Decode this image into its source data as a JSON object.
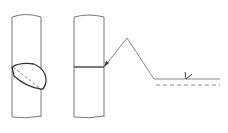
{
  "diagram": {
    "type": "weld-symbol-illustration",
    "background": "#ffffff",
    "stroke_dark": "#444444",
    "stroke_light": "#888888",
    "elements": [
      {
        "name": "tube-with-weld-view",
        "description": "Pipe with elliptical weld section"
      },
      {
        "name": "tube-with-joint-line",
        "description": "Pipe with horizontal joint line"
      },
      {
        "name": "arrow-leader",
        "description": "Leader arrow pointing to joint"
      },
      {
        "name": "reference-line",
        "description": "Solid reference line"
      },
      {
        "name": "dashed-reference-line",
        "description": "Dashed identification line"
      },
      {
        "name": "weld-symbol",
        "description": "Small weld symbol on reference line"
      }
    ]
  }
}
